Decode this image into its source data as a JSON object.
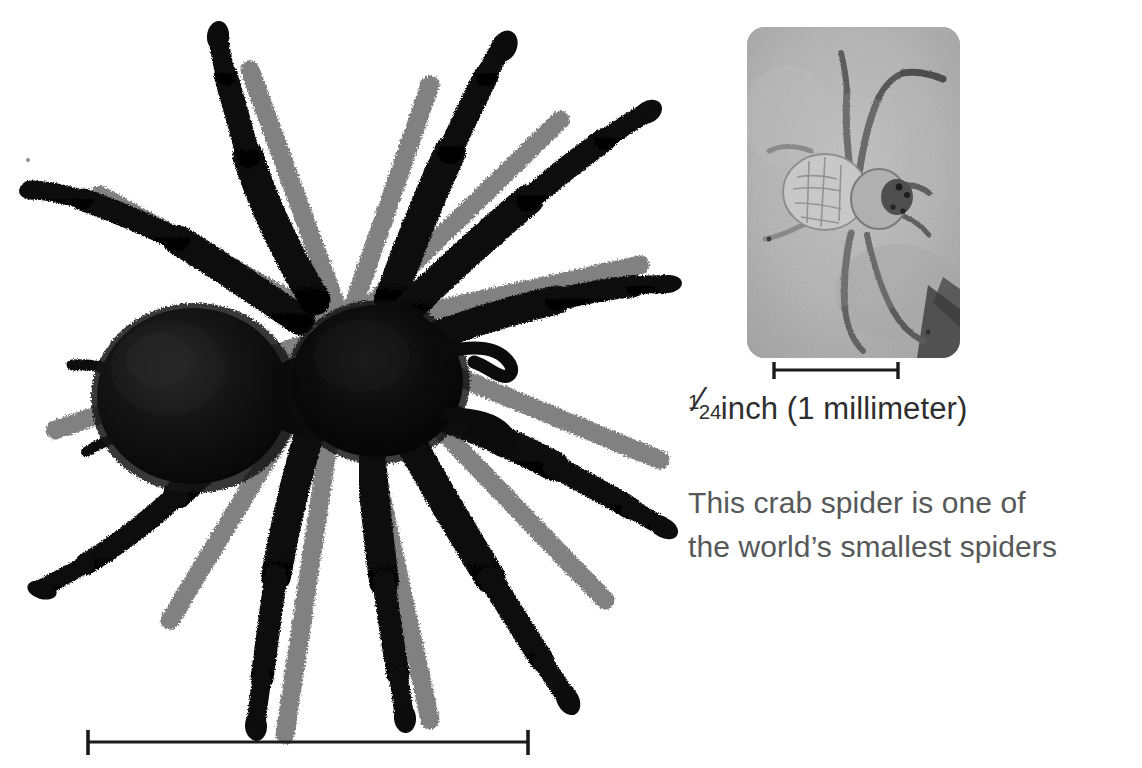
{
  "page": {
    "background_color": "#ffffff",
    "width": 1142,
    "height": 768
  },
  "main_figure": {
    "subject": "tarantula-spider-photograph",
    "description": "Large black hairy tarantula photographed from above on white background",
    "body_color": "#0a0a0a",
    "scale_bar": {
      "name": "main-scale-bar",
      "label": "",
      "x_start": 86,
      "x_end": 530,
      "y": 742
    }
  },
  "inset_figure": {
    "subject": "crab-spider-photograph",
    "description": "Small pale crab spider on gray stone surface",
    "background_color": "#b2b2b2",
    "corner_radius": 18,
    "scale_bar": {
      "name": "inset-scale-bar",
      "x_start": 772,
      "x_end": 900,
      "y": 370
    }
  },
  "scale_caption": {
    "fraction_numerator": "1",
    "fraction_solidus": "⁄",
    "fraction_denominator": "24",
    "unit": "inch (1 millimeter)",
    "full_text": "¹⁄24 inch (1 millimeter)",
    "color": "#2e2e2e"
  },
  "photo_caption": {
    "line1": "This crab spider is one of",
    "line2": "the world’s smallest spiders",
    "full_text": "This crab spider is one of the world’s smallest spiders",
    "color": "#56585a"
  }
}
